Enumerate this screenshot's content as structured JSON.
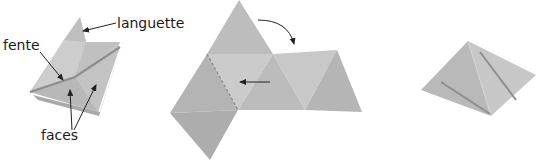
{
  "labels": {
    "tab": "languette",
    "slot": "fente",
    "faces": "faces"
  },
  "colors": {
    "light_face": "#c9c9c9",
    "mid_face": "#bdbdbd",
    "dark_face": "#b0b0b0",
    "slot_line": "#8e8e8e",
    "arrow": "#222222"
  }
}
